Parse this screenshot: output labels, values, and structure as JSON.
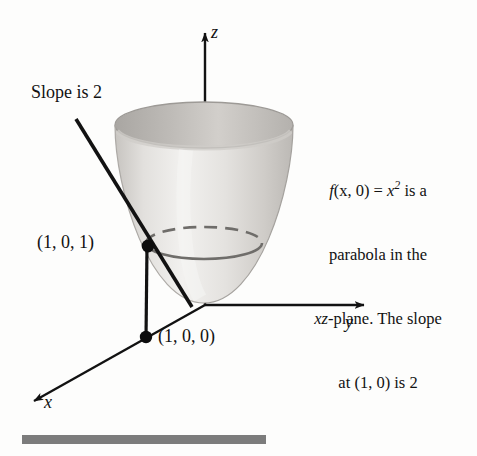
{
  "figure": {
    "kind": "3d-coordinate-diagram",
    "caption_bar_color": "#7c7c7c",
    "axes": {
      "x_label": "x",
      "y_label": "y",
      "z_label": "z",
      "axis_color": "#121212"
    },
    "labels": {
      "slope_note": "Slope is 2",
      "point_on_surface": "(1, 0, 1)",
      "point_on_plane": "(1, 0, 0)"
    },
    "annotation": {
      "line1_prefix": "f",
      "line1_args": "(x, 0) = ",
      "line1_var": "x",
      "line1_exponent": "2",
      "line1_suffix": " is a",
      "line2": "parabola in the",
      "line3_italic": "xz",
      "line3_rest": "-plane. The slope",
      "line4": "at (1, 0) is 2"
    },
    "surface": {
      "name": "paraboloid",
      "fill_light": "#f0efee",
      "fill_mid": "#d8d6d3",
      "fill_dark": "#b9b6b2",
      "rim_inner": "#a8a5a1",
      "trace_color": "#6f6d6a"
    },
    "geometry": {
      "origin": [
        205,
        305
      ],
      "z_axis_tip": [
        205,
        26
      ],
      "y_axis_tip": [
        372,
        305
      ],
      "x_axis_tip": [
        27,
        406
      ],
      "tangent_start": [
        76,
        119
      ],
      "tangent_end": [
        192,
        307
      ],
      "point_101": [
        148,
        246
      ],
      "point_100": [
        146,
        337
      ],
      "top_rim_center": [
        204,
        125
      ],
      "top_rim_rx": 89,
      "top_rim_ry": 23,
      "trace_center": [
        204,
        243
      ],
      "trace_rx": 58,
      "trace_ry": 16
    }
  }
}
